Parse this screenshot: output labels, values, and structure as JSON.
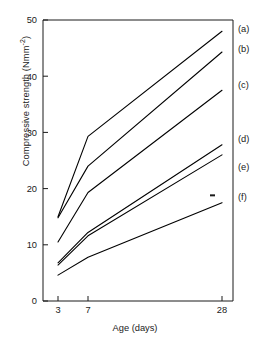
{
  "chart_data": {
    "type": "line",
    "title": "",
    "xlabel": "Age (days)",
    "ylabel": "Compressive strength (Nmm-2)",
    "ylabel_base": "Compressive strength (Nmm",
    "ylabel_sup": "-2",
    "ylabel_tail": ")",
    "x": [
      3,
      7,
      28
    ],
    "x_tick_labels": [
      "3",
      "7",
      "28"
    ],
    "y_tick_labels": [
      "0",
      "10",
      "20",
      "30",
      "40",
      "50"
    ],
    "y_ticks": [
      0,
      10,
      20,
      30,
      40,
      50
    ],
    "ylim": [
      0,
      50
    ],
    "x_axis_scale": "categorical-nonlinear",
    "grid": false,
    "legend_position": "right-inline-labels",
    "line_color": "#000000",
    "series": [
      {
        "name": "(a)",
        "label": "(a)",
        "values": [
          15.0,
          29.3,
          48.0
        ]
      },
      {
        "name": "(b)",
        "label": "(b)",
        "values": [
          14.8,
          24.0,
          44.3
        ]
      },
      {
        "name": "(c)",
        "label": "(c)",
        "values": [
          10.5,
          19.3,
          37.5
        ]
      },
      {
        "name": "(d)",
        "label": "(d)",
        "values": [
          6.8,
          12.2,
          27.8
        ]
      },
      {
        "name": "(e)",
        "label": "(e)",
        "values": [
          6.4,
          11.6,
          26.0
        ]
      },
      {
        "name": "(f)",
        "label": "(f)",
        "values": [
          4.6,
          7.8,
          17.5
        ]
      }
    ],
    "annotations": [
      {
        "name": "stray-ink-mark",
        "x_px": 210,
        "y_value": 18.8
      }
    ]
  }
}
